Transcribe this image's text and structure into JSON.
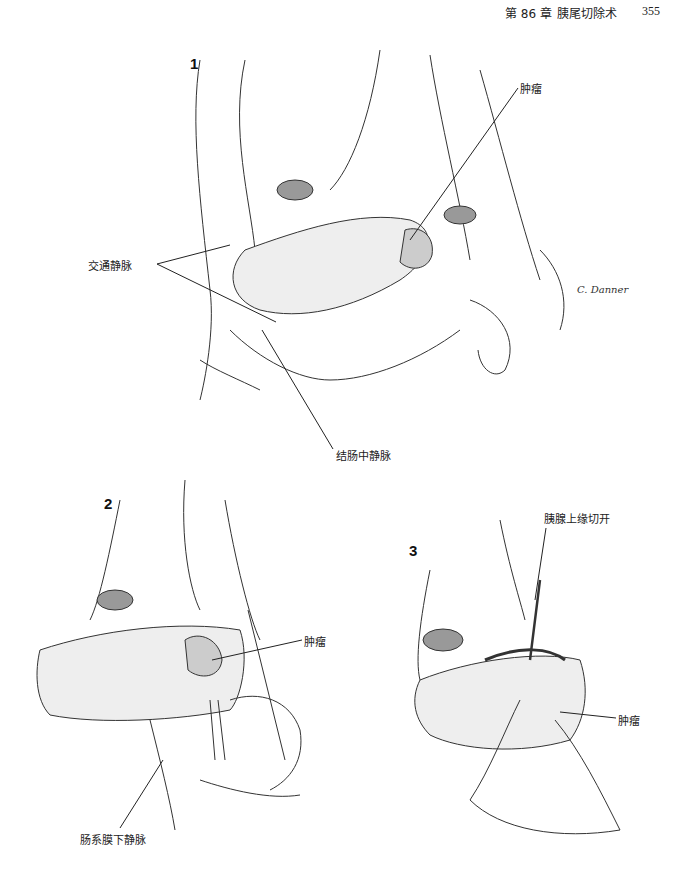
{
  "header": {
    "chapter": "第 86 章",
    "title": "胰尾切除术",
    "page_number": "355"
  },
  "figures": [
    {
      "number": "1",
      "labels": {
        "tumor": "肿瘤",
        "communicating_veins": "交通静脉",
        "middle_colic_vein": "结肠中静脉"
      },
      "signature": "C. Danner"
    },
    {
      "number": "2",
      "labels": {
        "tumor": "肿瘤",
        "inferior_mesenteric_vein": "肠系膜下静脉"
      }
    },
    {
      "number": "3",
      "labels": {
        "superior_border_incision": "胰腺上缘切开",
        "tumor": "肿瘤"
      }
    }
  ]
}
